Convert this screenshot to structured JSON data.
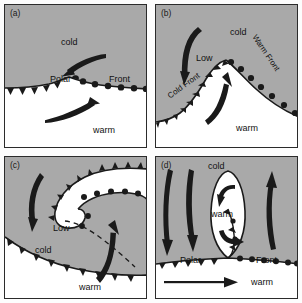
{
  "figure": {
    "background": "#ffffff",
    "cold_air_fill": "#a9a9a9",
    "warm_air_fill": "#ffffff",
    "line_color": "#1a1a1a"
  },
  "panels": [
    {
      "id": "a",
      "tag": "(a)",
      "caption": "Stationary polar front",
      "labels": {
        "cold": "cold",
        "warm": "warm",
        "front_left": "Polar",
        "front_right": "Front"
      },
      "arrows": [
        {
          "name": "cold-air-flow-arrow",
          "direction": "left-down"
        },
        {
          "name": "warm-air-flow-arrow",
          "direction": "right-up"
        }
      ],
      "front_symbols": [
        "cold-front-triangles",
        "warm-front-semicircles"
      ]
    },
    {
      "id": "b",
      "tag": "(b)",
      "caption": "Wave development, open wave cyclone",
      "labels": {
        "cold": "cold",
        "warm": "warm",
        "low": "Low",
        "cold_front": "Cold Front",
        "warm_front": "Warm Front"
      },
      "arrows": [
        {
          "name": "cold-air-flow-arrow",
          "direction": "down"
        },
        {
          "name": "warm-air-flow-arrow",
          "direction": "up"
        }
      ],
      "front_symbols": [
        "cold-front-triangles",
        "warm-front-semicircles"
      ]
    },
    {
      "id": "c",
      "tag": "(c)",
      "caption": "Occlusion, spiral of cold air wrapping the low",
      "labels": {
        "cold": "cold",
        "warm": "warm",
        "low": "Low"
      },
      "arrows": [
        {
          "name": "cold-air-flow-arrow",
          "direction": "down"
        },
        {
          "name": "warm-air-flow-arrow",
          "direction": "up"
        }
      ],
      "front_symbols": [
        "cold-front-triangles",
        "warm-front-semicircles",
        "occluded-dashed-line"
      ]
    },
    {
      "id": "d",
      "tag": "(d)",
      "caption": "Dissipating stage, cut-off warm pocket",
      "labels": {
        "cold": "cold",
        "warm_pocket": "warm",
        "warm_bottom": "warm",
        "front_left": "Polar",
        "front_right": "Front"
      },
      "arrows": [
        {
          "name": "cold-air-flow-arrow-1",
          "direction": "down"
        },
        {
          "name": "cold-air-flow-arrow-2",
          "direction": "down"
        },
        {
          "name": "cold-air-flow-arrow-3",
          "direction": "up"
        },
        {
          "name": "warm-pocket-circulation-arrow-top",
          "direction": "counterclockwise"
        },
        {
          "name": "warm-pocket-circulation-arrow-bottom",
          "direction": "counterclockwise"
        },
        {
          "name": "warm-advection-arrow",
          "direction": "right"
        }
      ],
      "front_symbols": [
        "cold-front-triangles",
        "warm-front-semicircles"
      ]
    }
  ]
}
